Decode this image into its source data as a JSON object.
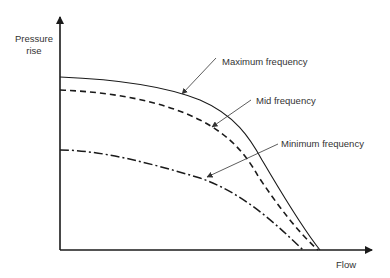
{
  "diagram": {
    "type": "pump/fan characteristic curves",
    "axes": {
      "y_label_line1": "Pressure",
      "y_label_line2": "rise",
      "x_label": "Flow"
    },
    "curves": [
      {
        "id": "max",
        "label": "Maximum frequency",
        "line_style": "solid"
      },
      {
        "id": "mid",
        "label": "Mid frequency",
        "line_style": "dashed"
      },
      {
        "id": "min",
        "label": "Minimum frequency",
        "line_style": "dash-dot"
      }
    ],
    "colors": {
      "ink": "#1a1a1a",
      "text": "#333333",
      "background": "#ffffff"
    }
  }
}
